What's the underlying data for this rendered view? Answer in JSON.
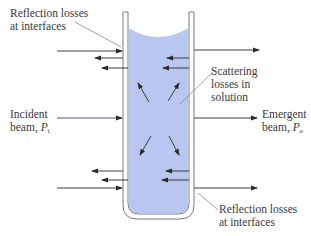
{
  "colors": {
    "liquid": "#b7c7ef",
    "glass": "#ffffff",
    "glass_outline": "#7a7a7a",
    "arrow": "#2a2a2a",
    "incident_beam": "#3b3f8a",
    "leader_line": "#8a8a8a",
    "text": "#3a3a3a"
  },
  "labels": {
    "reflection_top": {
      "line1": "Reflection losses",
      "line2": "at interfaces"
    },
    "scattering": {
      "line1": "Scattering",
      "line2": "losses in",
      "line3": "solution"
    },
    "incident": {
      "line1": "Incident",
      "line2_prefix": "beam, ",
      "symbol": "P",
      "subscript": "i"
    },
    "emergent": {
      "line1": "Emergent",
      "line2_prefix": "beam, ",
      "symbol": "P",
      "subscript": "e"
    },
    "reflection_bottom": {
      "line1": "Reflection losses",
      "line2": "at interfaces"
    }
  },
  "diagram": {
    "type": "cuvette-light-loss",
    "components": [
      "cuvette",
      "solution",
      "incident-beam",
      "emergent-beam",
      "reflected-beams",
      "scattered-rays"
    ]
  }
}
